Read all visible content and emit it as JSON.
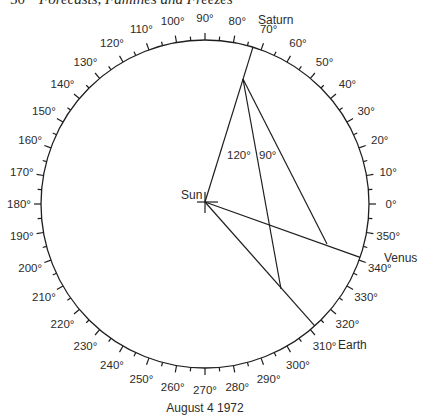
{
  "header": {
    "page_number": "50",
    "title": "Forecasts, Famines and Freezes"
  },
  "diagram": {
    "caption": "August 4 1972",
    "circle": {
      "cx": 205,
      "cy": 204,
      "r": 164,
      "stroke": "#1e1e1e"
    },
    "ticks": {
      "major_every_deg": 10,
      "minor_every_deg": 5,
      "major_len": 7,
      "minor_len": 4
    },
    "degree_labels": [
      "0°",
      "10°",
      "20°",
      "30°",
      "40°",
      "50°",
      "60°",
      "70°",
      "80°",
      "90°",
      "100°",
      "110°",
      "120°",
      "130°",
      "140°",
      "150°",
      "160°",
      "170°",
      "180°",
      "190°",
      "200°",
      "210°",
      "220°",
      "230°",
      "240°",
      "250°",
      "260°",
      "270°",
      "280°",
      "290°",
      "300°",
      "310°",
      "320°",
      "330°",
      "340°",
      "350°"
    ],
    "sun": {
      "label": "Sun",
      "x": 205,
      "y": 202
    },
    "planets": [
      {
        "name": "Saturn",
        "longitude_deg": 73,
        "label_x": 258,
        "label_y": 24
      },
      {
        "name": "Venus",
        "longitude_deg": 341,
        "label_x": 384,
        "label_y": 262
      },
      {
        "name": "Earth",
        "longitude_deg": 312,
        "label_x": 338,
        "label_y": 349
      }
    ],
    "vertex": {
      "x": 243,
      "y": 79
    },
    "construction_lines": [
      {
        "from": "vertex",
        "to": {
          "x": 281,
          "y": 289
        },
        "note": "meets Sun–Earth line"
      },
      {
        "from": "vertex",
        "to": {
          "x": 327,
          "y": 244
        },
        "note": "meets Sun–Venus line"
      }
    ],
    "angle_labels": [
      {
        "text": "120°",
        "x": 227,
        "y": 159
      },
      {
        "text": "90°",
        "x": 259,
        "y": 159
      }
    ]
  }
}
